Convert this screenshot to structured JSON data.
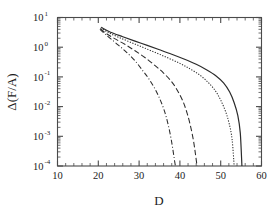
{
  "chart_data": {
    "type": "line",
    "title": "",
    "xlabel": "D",
    "ylabel": "Δ(F/A)",
    "xlim": [
      10,
      60
    ],
    "ylim": [
      0.0001,
      10
    ],
    "yscale": "log",
    "xscale": "linear",
    "grid": false,
    "legend": "none",
    "xticks": [
      10,
      20,
      30,
      40,
      50,
      60
    ],
    "xticklabels": [
      "10",
      "20",
      "30",
      "40",
      "50",
      "60"
    ],
    "yticks": [
      0.0001,
      0.001,
      0.01,
      0.1,
      1,
      10
    ],
    "yticklabels": [
      "10",
      "10",
      "10",
      "10",
      "10",
      "10"
    ],
    "yticklabel_exponents": [
      "-4",
      "-3",
      "-2",
      "-1",
      "0",
      "1"
    ],
    "series": [
      {
        "name": "curve-1-dash-dot",
        "style": "dashdot",
        "x": [
          20.4,
          21.5,
          23.0,
          25.0,
          27.0,
          29.0,
          31.0,
          32.5,
          34.0,
          35.2,
          36.2,
          37.0,
          37.7,
          38.2,
          38.6,
          38.9
        ],
        "y": [
          4.0,
          2.9,
          1.95,
          1.15,
          0.66,
          0.35,
          0.155,
          0.082,
          0.037,
          0.0165,
          0.0072,
          0.0029,
          0.00105,
          0.00042,
          0.00018,
          0.0001
        ]
      },
      {
        "name": "curve-2-dashed",
        "style": "dashed",
        "x": [
          20.5,
          22.0,
          24.0,
          26.5,
          29.0,
          31.5,
          34.0,
          36.0,
          38.0,
          39.5,
          40.8,
          41.8,
          42.6,
          43.3,
          43.8,
          44.2
        ],
        "y": [
          4.2,
          2.85,
          1.95,
          1.25,
          0.76,
          0.44,
          0.235,
          0.135,
          0.068,
          0.033,
          0.0145,
          0.0058,
          0.0022,
          0.00075,
          0.00026,
          0.0001
        ]
      },
      {
        "name": "curve-3-dotted",
        "style": "dotted",
        "x": [
          20.6,
          22.5,
          25.0,
          28.0,
          31.0,
          34.0,
          37.0,
          40.0,
          42.5,
          45.0,
          47.0,
          48.7,
          50.0,
          51.2,
          52.1,
          52.8,
          53.3
        ],
        "y": [
          4.5,
          3.1,
          2.15,
          1.45,
          0.98,
          0.66,
          0.44,
          0.285,
          0.185,
          0.112,
          0.064,
          0.034,
          0.0165,
          0.0068,
          0.0026,
          0.00078,
          0.0001
        ]
      },
      {
        "name": "curve-4-solid",
        "style": "solid",
        "x": [
          20.7,
          23.0,
          26.0,
          29.0,
          32.0,
          35.0,
          38.0,
          41.0,
          44.0,
          46.5,
          48.8,
          50.7,
          52.2,
          53.3,
          54.2,
          54.8,
          55.2
        ],
        "y": [
          4.7,
          3.2,
          2.25,
          1.6,
          1.15,
          0.82,
          0.58,
          0.4,
          0.265,
          0.175,
          0.11,
          0.063,
          0.031,
          0.0135,
          0.005,
          0.0013,
          0.0001
        ]
      }
    ]
  },
  "axes": {
    "x_label_text": "D",
    "y_label_text": "Δ(F/A)",
    "tick_base": "10"
  }
}
